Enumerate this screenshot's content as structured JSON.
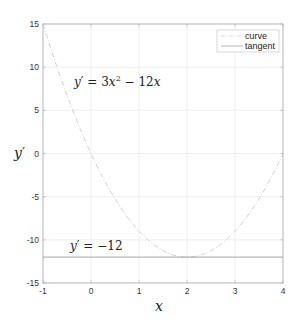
{
  "chart_data": {
    "type": "line",
    "title": "",
    "xlabel": "x",
    "ylabel": "y'",
    "xlim": [
      -1,
      4
    ],
    "ylim": [
      -15,
      15
    ],
    "grid": true,
    "legend_position": "top-right",
    "xticks": [
      -1,
      0,
      1,
      2,
      3,
      4
    ],
    "yticks": [
      -15,
      -10,
      -5,
      0,
      5,
      10,
      15
    ],
    "xtick_labels": [
      "-1",
      "0",
      "1",
      "2",
      "3",
      "4"
    ],
    "ytick_labels": [
      "-15",
      "-10",
      "-5",
      "0",
      "5",
      "10",
      "15"
    ],
    "series": [
      {
        "name": "curve",
        "function": "y' = 3x^2 - 12x",
        "style": "dash-dot",
        "color": "#c8c8c8",
        "x": [
          -1,
          -0.5,
          0,
          0.5,
          1,
          1.5,
          2,
          2.5,
          3,
          3.5,
          4
        ],
        "y": [
          15,
          6.75,
          0,
          -5.25,
          -9,
          -11.25,
          -12,
          -11.25,
          -9,
          -5.25,
          0
        ]
      },
      {
        "name": "tangent",
        "function": "y' = -12",
        "style": "solid",
        "color": "#9a9a9a",
        "x": [
          -1,
          4
        ],
        "y": [
          -12,
          -12
        ]
      }
    ],
    "annotations": [
      {
        "text": "y' = 3x^2 - 12x",
        "x": -0.65,
        "y": 8.2
      },
      {
        "text": "y' = -12",
        "x": -0.7,
        "y": -10.7
      }
    ]
  },
  "labels": {
    "xlabel": "x",
    "ylabel": "y",
    "ylabel_prime": "′",
    "legend": [
      "curve",
      "tangent"
    ],
    "annot1_lhs": "y",
    "annot1_prime": "′",
    "annot1_eq": " = 3",
    "annot1_x": "x",
    "annot1_sup": "2",
    "annot1_rest": " − 12",
    "annot1_x2": "x",
    "annot2_lhs": "y",
    "annot2_prime": "′",
    "annot2_rest": " = −12"
  }
}
